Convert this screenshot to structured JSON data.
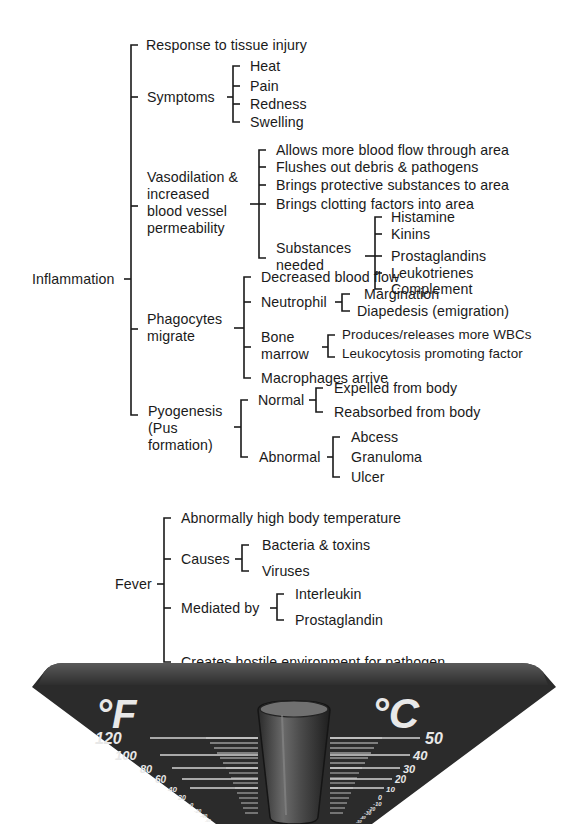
{
  "inflammation": {
    "root": "Inflammation",
    "response": "Response to tissue injury",
    "symptoms": {
      "label": "Symptoms",
      "items": [
        "Heat",
        "Pain",
        "Redness",
        "Swelling"
      ]
    },
    "vasodilation": {
      "label": "Vasodilation &\nincreased\nblood vessel\npermeability",
      "items": [
        "Allows more blood flow through area",
        "Flushes out debris & pathogens",
        "Brings protective substances to area",
        "Brings clotting factors into area"
      ],
      "substances": {
        "label": "Substances\nneeded",
        "items": [
          "Histamine",
          "Kinins",
          "Prostaglandins",
          "Leukotrienes",
          "Complement"
        ]
      }
    },
    "phagocytes": {
      "label": "Phagocytes\nmigrate",
      "decreased": "Decreased blood flow",
      "neutrophil": {
        "label": "Neutrophil",
        "items": [
          "Margination",
          "Diapedesis (emigration)"
        ]
      },
      "bone_marrow": {
        "label": "Bone\nmarrow",
        "items": [
          "Produces/releases more WBCs",
          "Leukocytosis promoting factor"
        ]
      },
      "macrophages": "Macrophages arrive"
    },
    "pyogenesis": {
      "label": "Pyogenesis\n(Pus\nformation)",
      "normal": {
        "label": "Normal",
        "items": [
          "Expelled from body",
          "Reabsorbed from body"
        ]
      },
      "abnormal": {
        "label": "Abnormal",
        "items": [
          "Abcess",
          "Granuloma",
          "Ulcer"
        ]
      }
    }
  },
  "fever": {
    "root": "Fever",
    "high_temp": "Abnormally high body temperature",
    "causes": {
      "label": "Causes",
      "items": [
        "Bacteria & toxins",
        "Viruses"
      ]
    },
    "mediated": {
      "label": "Mediated by",
      "items": [
        "Interleukin",
        "Prostaglandin"
      ]
    },
    "hostile": "Creates hostile environment for pathogen"
  },
  "thermometer": {
    "fahrenheit_unit": "°F",
    "celsius_unit": "°C",
    "fahrenheit_ticks": [
      "120",
      "100",
      "80",
      "60",
      "40",
      "20",
      "0",
      "-20",
      "-40",
      "-60"
    ],
    "celsius_ticks": [
      "50",
      "40",
      "30",
      "20",
      "10",
      "0",
      "-10",
      "-20",
      "-30",
      "-40",
      "-50"
    ],
    "colors": {
      "body": "#2b2b2b",
      "rim": "#4a4a4a",
      "scale_lines": "#bdbdbd",
      "tube": "#555555"
    }
  }
}
